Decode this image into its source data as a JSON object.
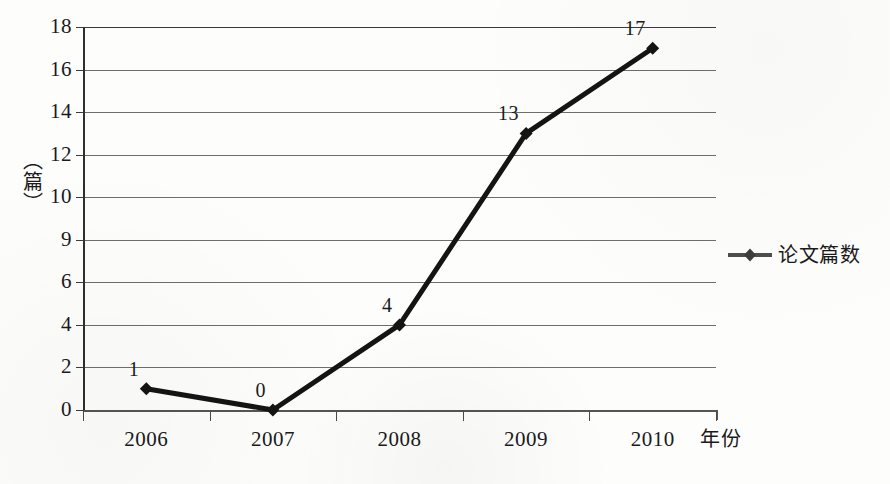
{
  "chart_data": {
    "type": "line",
    "title": "",
    "subtitle": "",
    "xlabel": "年份",
    "ylabel": "（篇）",
    "categories": [
      "2006",
      "2007",
      "2008",
      "2009",
      "2010"
    ],
    "series": [
      {
        "name": "论文篇数",
        "values": [
          1,
          0,
          4,
          13,
          17
        ],
        "point_labels": [
          "1",
          "0",
          "4",
          "13",
          "17"
        ],
        "marker": "diamond",
        "color": "#141414"
      }
    ],
    "ytick_labels": [
      "0",
      "2",
      "4",
      "6",
      "9",
      "10",
      "12",
      "14",
      "16",
      "18"
    ],
    "ytick_values": [
      0,
      2,
      4,
      6,
      8,
      10,
      12,
      14,
      16,
      18
    ],
    "ylim": [
      0,
      18
    ],
    "grid": true,
    "grid_axis": "y",
    "legend_position": "right",
    "legend_entries": [
      "论文篇数"
    ],
    "gridline_color": "#6e6e6e",
    "axis_color": "#2e2e2e",
    "background_color": "#fdfdfc"
  },
  "caption": {
    "text": ""
  }
}
